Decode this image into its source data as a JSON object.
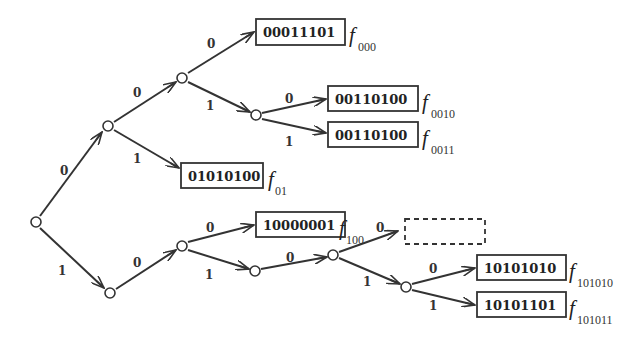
{
  "diagram": {
    "title": "",
    "type": "binary code tree",
    "nodes": [
      {
        "id": "root",
        "x": 36,
        "y": 222
      },
      {
        "id": "n0",
        "x": 108,
        "y": 126
      },
      {
        "id": "n00",
        "x": 182,
        "y": 78
      },
      {
        "id": "n001",
        "x": 256,
        "y": 115
      },
      {
        "id": "n1",
        "x": 110,
        "y": 293
      },
      {
        "id": "n10",
        "x": 182,
        "y": 246
      },
      {
        "id": "n101",
        "x": 255,
        "y": 271
      },
      {
        "id": "n1010",
        "x": 333,
        "y": 255
      },
      {
        "id": "n10101",
        "x": 406,
        "y": 287
      }
    ],
    "edges": [
      {
        "from": "root",
        "to": "n0",
        "label": "0"
      },
      {
        "from": "root",
        "to": "n1",
        "label": "1"
      },
      {
        "from": "n0",
        "to": "n00",
        "label": "0"
      },
      {
        "from": "n0",
        "to": "leaf01",
        "label": "1"
      },
      {
        "from": "n00",
        "to": "leaf000",
        "label": "0"
      },
      {
        "from": "n00",
        "to": "n001",
        "label": "1"
      },
      {
        "from": "n001",
        "to": "leaf0010",
        "label": "0"
      },
      {
        "from": "n001",
        "to": "leaf0011",
        "label": "1"
      },
      {
        "from": "n1",
        "to": "n10",
        "label": "0"
      },
      {
        "from": "n10",
        "to": "leaf100",
        "label": "0"
      },
      {
        "from": "n10",
        "to": "n101",
        "label": "1"
      },
      {
        "from": "n101",
        "to": "n1010",
        "label": "0"
      },
      {
        "from": "n1010",
        "to": "empty",
        "label": "0"
      },
      {
        "from": "n1010",
        "to": "n10101",
        "label": "1"
      },
      {
        "from": "n10101",
        "to": "leaf101010",
        "label": "0"
      },
      {
        "from": "n10101",
        "to": "leaf101011",
        "label": "1"
      }
    ],
    "leaves": [
      {
        "id": "leaf000",
        "code": "00011101",
        "f": "f",
        "sub": "000"
      },
      {
        "id": "leaf0010",
        "code": "00110100",
        "f": "f",
        "sub": "0010"
      },
      {
        "id": "leaf0011",
        "code": "00110100",
        "f": "f",
        "sub": "0011"
      },
      {
        "id": "leaf01",
        "code": "01010100",
        "f": "f",
        "sub": "01"
      },
      {
        "id": "leaf100",
        "code": "10000001",
        "f": "f",
        "sub": "100"
      },
      {
        "id": "empty",
        "code": "",
        "f": "",
        "sub": "",
        "dashed": true
      },
      {
        "id": "leaf101010",
        "code": "10101010",
        "f": "f",
        "sub": "101010"
      },
      {
        "id": "leaf101011",
        "code": "10101101",
        "f": "f",
        "sub": "101011"
      }
    ],
    "colors": {
      "line": "#333333",
      "background": "#ffffff"
    }
  }
}
